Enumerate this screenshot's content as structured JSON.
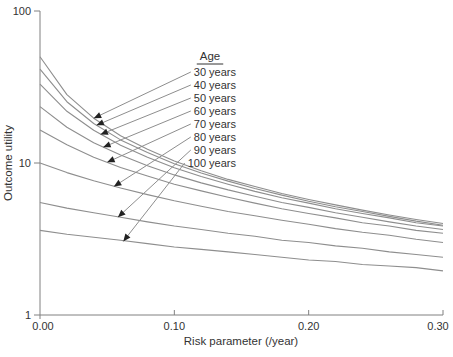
{
  "figure": {
    "background": "#ffffff"
  },
  "chart_data": {
    "type": "line",
    "xlabel": "Risk parameter (/year)",
    "ylabel": "Outcome utility",
    "xlim": [
      0,
      0.3
    ],
    "ylim": [
      1,
      100
    ],
    "y_scale": "log",
    "grid": false,
    "x_ticks": {
      "values": [
        0,
        0.1,
        0.2,
        0.3
      ],
      "labels": [
        "0.00",
        "0.10",
        "0.20",
        "0.30"
      ]
    },
    "y_ticks": {
      "values": [
        100,
        10,
        1
      ],
      "labels": [
        "100",
        "10",
        "1"
      ]
    },
    "x": [
      0,
      0.02,
      0.04,
      0.06,
      0.08,
      0.1,
      0.12,
      0.14,
      0.16,
      0.18,
      0.2,
      0.22,
      0.24,
      0.26,
      0.28,
      0.3
    ],
    "series": [
      {
        "name": "30 years",
        "values": [
          50.0,
          28.2,
          19.7,
          15.1,
          12.3,
          10.3,
          8.9,
          7.8,
          7.0,
          6.3,
          5.75,
          5.3,
          4.9,
          4.55,
          4.25,
          4.0
        ],
        "arrow": {
          "x": 0.04,
          "y": 19.7
        }
      },
      {
        "name": "40 years",
        "values": [
          41.5,
          25.3,
          18.2,
          14.2,
          11.7,
          9.9,
          8.6,
          7.6,
          6.8,
          6.15,
          5.6,
          5.15,
          4.8,
          4.45,
          4.15,
          3.9
        ],
        "arrow": {
          "x": 0.042,
          "y": 17.7
        }
      },
      {
        "name": "50 years",
        "values": [
          33.0,
          21.9,
          16.4,
          13.1,
          10.9,
          9.3,
          8.15,
          7.25,
          6.5,
          5.9,
          5.45,
          5.0,
          4.65,
          4.35,
          4.05,
          3.85
        ],
        "arrow": {
          "x": 0.045,
          "y": 15.4
        }
      },
      {
        "name": "60 years",
        "values": [
          23.5,
          17.2,
          13.6,
          11.3,
          9.6,
          8.35,
          7.4,
          6.65,
          6.05,
          5.5,
          5.1,
          4.7,
          4.4,
          4.1,
          3.85,
          3.65
        ],
        "arrow": {
          "x": 0.047,
          "y": 12.7
        }
      },
      {
        "name": "70 years",
        "values": [
          16.5,
          13.2,
          10.9,
          9.35,
          8.2,
          7.25,
          6.55,
          5.95,
          5.45,
          5.0,
          4.65,
          4.35,
          4.05,
          3.85,
          3.6,
          3.45
        ],
        "arrow": {
          "x": 0.05,
          "y": 10.1
        }
      },
      {
        "name": "80 years",
        "values": [
          10.0,
          8.65,
          7.65,
          6.85,
          6.2,
          5.65,
          5.2,
          4.8,
          4.5,
          4.2,
          3.95,
          3.7,
          3.5,
          3.35,
          3.15,
          3.0
        ],
        "arrow": {
          "x": 0.055,
          "y": 7.0
        }
      },
      {
        "name": "90 years",
        "values": [
          5.5,
          5.05,
          4.7,
          4.4,
          4.1,
          3.85,
          3.65,
          3.45,
          3.3,
          3.1,
          3.0,
          2.85,
          2.75,
          2.6,
          2.5,
          2.4
        ],
        "arrow": {
          "x": 0.058,
          "y": 4.4
        }
      },
      {
        "name": "100 years",
        "values": [
          3.6,
          3.4,
          3.25,
          3.1,
          2.95,
          2.8,
          2.7,
          2.6,
          2.5,
          2.4,
          2.3,
          2.25,
          2.15,
          2.1,
          2.05,
          1.95
        ],
        "arrow": {
          "x": 0.062,
          "y": 3.05
        }
      }
    ],
    "legend": {
      "title": "Age",
      "position": "top-center",
      "title_underlined": true
    },
    "colors": {
      "curve": "#8e8e8e",
      "axis": "#808080",
      "text": "#333333",
      "leader_line": "#8e8e8e",
      "arrowhead": "#222222"
    }
  }
}
